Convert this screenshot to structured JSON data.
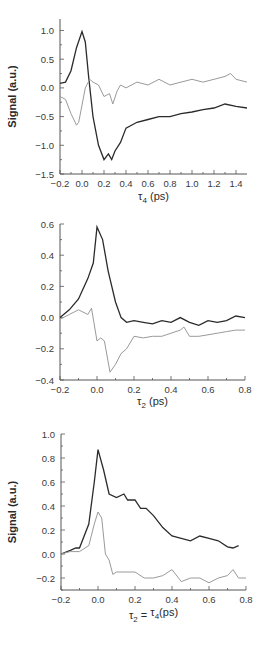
{
  "colors": {
    "dark_trace": "#2b2b2b",
    "light_trace": "#9a9a9a",
    "axis": "#555555"
  },
  "chart_data": [
    {
      "type": "line",
      "title": "",
      "xlabel": "τ4 (ps)",
      "xlabel_main": "τ",
      "xlabel_sub": "4",
      "xlabel_rest": " (ps)",
      "ylabel": "Signal (a.u.)",
      "xlim": [
        -0.2,
        1.5
      ],
      "ylim": [
        -1.5,
        1.2
      ],
      "xticks": [
        "-0.2",
        "0.0",
        "0.2",
        "0.4",
        "0.6",
        "0.8",
        "1.0",
        "1.2",
        "1.4"
      ],
      "yticks": [
        "1.0",
        "0.5",
        "0.0",
        "-0.5",
        "-1.0",
        "-1.5"
      ],
      "grid": false,
      "series": [
        {
          "name": "dark",
          "x": [
            -0.2,
            -0.15,
            -0.1,
            -0.05,
            0.0,
            0.03,
            0.06,
            0.1,
            0.15,
            0.2,
            0.24,
            0.27,
            0.3,
            0.35,
            0.4,
            0.5,
            0.6,
            0.7,
            0.8,
            0.9,
            1.0,
            1.1,
            1.2,
            1.3,
            1.4,
            1.5
          ],
          "y": [
            0.08,
            0.1,
            0.3,
            0.7,
            0.98,
            0.8,
            0.2,
            -0.5,
            -1.0,
            -1.25,
            -1.15,
            -1.25,
            -1.1,
            -0.95,
            -0.7,
            -0.6,
            -0.55,
            -0.5,
            -0.5,
            -0.45,
            -0.42,
            -0.38,
            -0.35,
            -0.28,
            -0.32,
            -0.35
          ]
        },
        {
          "name": "light",
          "x": [
            -0.2,
            -0.15,
            -0.1,
            -0.05,
            -0.03,
            0.0,
            0.03,
            0.07,
            0.1,
            0.15,
            0.2,
            0.25,
            0.28,
            0.32,
            0.35,
            0.4,
            0.5,
            0.6,
            0.7,
            0.8,
            0.9,
            1.0,
            1.1,
            1.2,
            1.3,
            1.35,
            1.4,
            1.5
          ],
          "y": [
            -0.15,
            -0.2,
            -0.45,
            -0.65,
            -0.6,
            -0.3,
            0.0,
            0.15,
            0.1,
            0.05,
            -0.15,
            -0.1,
            -0.28,
            -0.05,
            0.05,
            0.0,
            0.1,
            0.05,
            0.15,
            0.05,
            0.1,
            0.15,
            0.1,
            0.15,
            0.2,
            0.25,
            0.15,
            0.1
          ]
        }
      ]
    },
    {
      "type": "line",
      "title": "",
      "xlabel": "τ2 (ps)",
      "xlabel_main": "τ",
      "xlabel_sub": "2",
      "xlabel_rest": " (ps)",
      "ylabel": "",
      "xlim": [
        -0.2,
        0.8
      ],
      "ylim": [
        -0.4,
        0.6
      ],
      "xticks": [
        "-0.2",
        "0.0",
        "0.2",
        "0.4",
        "0.6",
        "0.8"
      ],
      "yticks": [
        "0.6",
        "0.4",
        "0.2",
        "0.0",
        "-0.2",
        "-0.4"
      ],
      "grid": false,
      "series": [
        {
          "name": "dark",
          "x": [
            -0.2,
            -0.15,
            -0.1,
            -0.05,
            -0.02,
            0.0,
            0.03,
            0.06,
            0.1,
            0.13,
            0.16,
            0.2,
            0.25,
            0.3,
            0.35,
            0.4,
            0.45,
            0.5,
            0.55,
            0.6,
            0.65,
            0.7,
            0.75,
            0.8
          ],
          "y": [
            0.0,
            0.05,
            0.12,
            0.25,
            0.35,
            0.58,
            0.5,
            0.3,
            0.1,
            0.0,
            -0.03,
            -0.02,
            -0.03,
            -0.04,
            -0.02,
            -0.03,
            0.0,
            -0.03,
            -0.05,
            -0.02,
            -0.03,
            -0.02,
            0.01,
            0.0
          ]
        },
        {
          "name": "light",
          "x": [
            -0.2,
            -0.15,
            -0.1,
            -0.05,
            -0.03,
            0.0,
            0.02,
            0.04,
            0.07,
            0.1,
            0.13,
            0.16,
            0.2,
            0.25,
            0.3,
            0.35,
            0.4,
            0.45,
            0.47,
            0.5,
            0.55,
            0.6,
            0.65,
            0.7,
            0.75,
            0.8
          ],
          "y": [
            -0.01,
            0.02,
            0.05,
            0.02,
            0.06,
            -0.15,
            -0.13,
            -0.15,
            -0.35,
            -0.3,
            -0.23,
            -0.2,
            -0.12,
            -0.13,
            -0.12,
            -0.12,
            -0.1,
            -0.08,
            -0.06,
            -0.12,
            -0.12,
            -0.11,
            -0.1,
            -0.09,
            -0.08,
            -0.08
          ]
        }
      ]
    },
    {
      "type": "line",
      "title": "",
      "xlabel": "τ2 = τ4(ps)",
      "xlabel_parts": [
        "τ",
        "2",
        " = ",
        "τ",
        "4",
        "(ps)"
      ],
      "ylabel": "Signal (a.u.)",
      "xlim": [
        -0.2,
        0.8
      ],
      "ylim": [
        -0.3,
        1.0
      ],
      "xticks": [
        "-0.2",
        "0.0",
        "0.2",
        "0.4",
        "0.6",
        "0.8"
      ],
      "yticks": [
        "1.0",
        "0.8",
        "0.6",
        "0.4",
        "0.2",
        "0.0",
        "-0.2"
      ],
      "grid": false,
      "series": [
        {
          "name": "dark",
          "x": [
            -0.2,
            -0.15,
            -0.12,
            -0.1,
            -0.05,
            -0.02,
            0.0,
            0.03,
            0.06,
            0.1,
            0.14,
            0.16,
            0.2,
            0.23,
            0.26,
            0.3,
            0.35,
            0.4,
            0.45,
            0.5,
            0.55,
            0.6,
            0.65,
            0.7,
            0.73,
            0.76
          ],
          "y": [
            0.0,
            0.03,
            0.05,
            0.05,
            0.25,
            0.6,
            0.87,
            0.7,
            0.5,
            0.47,
            0.5,
            0.45,
            0.45,
            0.38,
            0.38,
            0.32,
            0.22,
            0.15,
            0.13,
            0.11,
            0.15,
            0.13,
            0.11,
            0.06,
            0.05,
            0.07
          ]
        },
        {
          "name": "light",
          "x": [
            -0.2,
            -0.15,
            -0.1,
            -0.05,
            -0.02,
            0.0,
            0.02,
            0.04,
            0.06,
            0.08,
            0.1,
            0.15,
            0.2,
            0.25,
            0.3,
            0.35,
            0.4,
            0.45,
            0.5,
            0.55,
            0.6,
            0.65,
            0.7,
            0.73,
            0.76,
            0.8
          ],
          "y": [
            0.0,
            0.02,
            0.02,
            0.07,
            0.25,
            0.35,
            0.3,
            0.0,
            -0.05,
            -0.17,
            -0.15,
            -0.15,
            -0.15,
            -0.2,
            -0.2,
            -0.18,
            -0.13,
            -0.23,
            -0.2,
            -0.2,
            -0.24,
            -0.2,
            -0.18,
            -0.13,
            -0.2,
            -0.2
          ]
        }
      ]
    }
  ]
}
